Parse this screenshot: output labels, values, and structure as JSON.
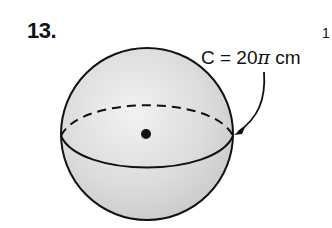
{
  "problem": {
    "number": "13.",
    "label_prefix": "C = 20",
    "label_pi": "π",
    "label_suffix": " cm",
    "edge_mark": "1"
  },
  "figure": {
    "shape": "sphere",
    "fill_color": "#d9d9d9",
    "stroke_color": "#111111",
    "center": [
      147,
      134
    ],
    "radius": 86,
    "great_circle_label": "C = 20π cm"
  }
}
